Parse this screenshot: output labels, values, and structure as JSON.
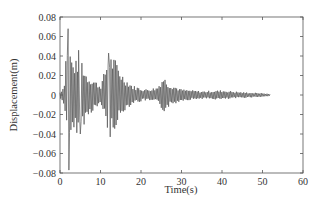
{
  "chart_data": {
    "type": "line",
    "title": "",
    "xlabel": "Time(s)",
    "ylabel": "Displacement(m)",
    "xlim": [
      0,
      60
    ],
    "ylim": [
      -0.08,
      0.08
    ],
    "xticks": [
      0,
      10,
      20,
      30,
      40,
      50,
      60
    ],
    "yticks": [
      0.08,
      0.06,
      0.04,
      0.02,
      0,
      -0.02,
      -0.04,
      -0.06,
      -0.08
    ],
    "xtick_labels": [
      "0",
      "10",
      "20",
      "30",
      "40",
      "50",
      "60"
    ],
    "ytick_labels": [
      "0.08",
      "0.06",
      "0.04",
      "0.02",
      "0",
      "−0.02",
      "−0.04",
      "−0.06",
      "−0.08"
    ],
    "grid": false,
    "legend": null,
    "series": [
      {
        "name": "Displacement",
        "color": "#555555",
        "envelope": [
          {
            "t": 0.0,
            "max": 0.003,
            "min": -0.003
          },
          {
            "t": 1.0,
            "max": 0.01,
            "min": -0.012
          },
          {
            "t": 1.5,
            "max": 0.047,
            "min": -0.022
          },
          {
            "t": 2.0,
            "max": 0.068,
            "min": -0.077
          },
          {
            "t": 3.0,
            "max": 0.035,
            "min": -0.045
          },
          {
            "t": 4.0,
            "max": 0.036,
            "min": -0.04
          },
          {
            "t": 5.0,
            "max": 0.046,
            "min": -0.035
          },
          {
            "t": 6.0,
            "max": 0.027,
            "min": -0.03
          },
          {
            "t": 7.0,
            "max": 0.02,
            "min": -0.022
          },
          {
            "t": 8.5,
            "max": 0.016,
            "min": -0.015
          },
          {
            "t": 10.0,
            "max": 0.01,
            "min": -0.012
          },
          {
            "t": 11.0,
            "max": 0.025,
            "min": -0.02
          },
          {
            "t": 12.0,
            "max": 0.043,
            "min": -0.043
          },
          {
            "t": 13.0,
            "max": 0.04,
            "min": -0.038
          },
          {
            "t": 14.0,
            "max": 0.035,
            "min": -0.032
          },
          {
            "t": 15.0,
            "max": 0.025,
            "min": -0.025
          },
          {
            "t": 16.0,
            "max": 0.018,
            "min": -0.016
          },
          {
            "t": 18.0,
            "max": 0.01,
            "min": -0.009
          },
          {
            "t": 21.0,
            "max": 0.006,
            "min": -0.006
          },
          {
            "t": 24.0,
            "max": 0.008,
            "min": -0.008
          },
          {
            "t": 25.5,
            "max": 0.02,
            "min": -0.018
          },
          {
            "t": 27.0,
            "max": 0.012,
            "min": -0.012
          },
          {
            "t": 30.0,
            "max": 0.006,
            "min": -0.006
          },
          {
            "t": 35.0,
            "max": 0.004,
            "min": -0.004
          },
          {
            "t": 40.0,
            "max": 0.005,
            "min": -0.005
          },
          {
            "t": 45.0,
            "max": 0.003,
            "min": -0.003
          },
          {
            "t": 50.0,
            "max": 0.002,
            "min": -0.002
          },
          {
            "t": 52.0,
            "max": 0.001,
            "min": -0.001
          }
        ]
      }
    ]
  }
}
